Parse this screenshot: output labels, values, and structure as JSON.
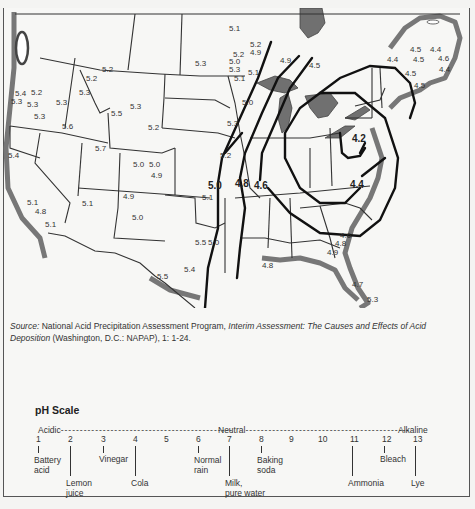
{
  "map": {
    "title": "Precipitation pH, continental United States and eastern Canada",
    "isopleth_labels": [
      {
        "value": "5.0",
        "x": 214,
        "y": 181
      },
      {
        "value": "4.8",
        "x": 240,
        "y": 179
      },
      {
        "value": "4.6",
        "x": 261,
        "y": 181
      },
      {
        "value": "4.4",
        "x": 352,
        "y": 180
      },
      {
        "value": "4.2",
        "x": 357,
        "y": 134
      }
    ],
    "station_values": [
      {
        "value": "5.1",
        "x": 229,
        "y": 23
      },
      {
        "value": "5.2",
        "x": 250,
        "y": 39
      },
      {
        "value": "4.9",
        "x": 250,
        "y": 47
      },
      {
        "value": "5.2",
        "x": 233,
        "y": 49
      },
      {
        "value": "5.0",
        "x": 229,
        "y": 56
      },
      {
        "value": "5.3",
        "x": 229,
        "y": 64
      },
      {
        "value": "5.1",
        "x": 248,
        "y": 67
      },
      {
        "value": "5.1",
        "x": 234,
        "y": 73
      },
      {
        "value": "5.0",
        "x": 242,
        "y": 97
      },
      {
        "value": "5.3",
        "x": 227,
        "y": 118
      },
      {
        "value": "5.2",
        "x": 220,
        "y": 150
      },
      {
        "value": "4.9",
        "x": 280,
        "y": 55
      },
      {
        "value": "4.5",
        "x": 309,
        "y": 60
      },
      {
        "value": "5.3",
        "x": 195,
        "y": 58
      },
      {
        "value": "5.2",
        "x": 102,
        "y": 64
      },
      {
        "value": "5.2",
        "x": 86,
        "y": 73
      },
      {
        "value": "5.4",
        "x": 15,
        "y": 88
      },
      {
        "value": "5.2",
        "x": 31,
        "y": 87
      },
      {
        "value": "5.3",
        "x": 11,
        "y": 96
      },
      {
        "value": "5.3",
        "x": 27,
        "y": 99
      },
      {
        "value": "5.3",
        "x": 56,
        "y": 97
      },
      {
        "value": "5.3",
        "x": 79,
        "y": 87
      },
      {
        "value": "5.3",
        "x": 34,
        "y": 111
      },
      {
        "value": "5.6",
        "x": 62,
        "y": 121
      },
      {
        "value": "5.5",
        "x": 111,
        "y": 108
      },
      {
        "value": "5.3",
        "x": 130,
        "y": 101
      },
      {
        "value": "5.2",
        "x": 148,
        "y": 122
      },
      {
        "value": "5.7",
        "x": 95,
        "y": 143
      },
      {
        "value": "5.4",
        "x": 8,
        "y": 150
      },
      {
        "value": "5.0",
        "x": 133,
        "y": 159
      },
      {
        "value": "5.0",
        "x": 149,
        "y": 159
      },
      {
        "value": "4.9",
        "x": 151,
        "y": 170
      },
      {
        "value": "4.9",
        "x": 123,
        "y": 191
      },
      {
        "value": "5.1",
        "x": 202,
        "y": 192
      },
      {
        "value": "5.1",
        "x": 27,
        "y": 197
      },
      {
        "value": "4.8",
        "x": 35,
        "y": 206
      },
      {
        "value": "5.1",
        "x": 45,
        "y": 219
      },
      {
        "value": "5.1",
        "x": 82,
        "y": 198
      },
      {
        "value": "5.0",
        "x": 132,
        "y": 212
      },
      {
        "value": "5.5",
        "x": 195,
        "y": 237
      },
      {
        "value": "5.0",
        "x": 208,
        "y": 237
      },
      {
        "value": "5.4",
        "x": 184,
        "y": 264
      },
      {
        "value": "5.5",
        "x": 157,
        "y": 271
      },
      {
        "value": "4.6",
        "x": 340,
        "y": 230
      },
      {
        "value": "4.8",
        "x": 335,
        "y": 238
      },
      {
        "value": "4.9",
        "x": 327,
        "y": 247
      },
      {
        "value": "4.8",
        "x": 262,
        "y": 260
      },
      {
        "value": "4.7",
        "x": 352,
        "y": 279
      },
      {
        "value": "5.3",
        "x": 367,
        "y": 294
      },
      {
        "value": "4.4",
        "x": 387,
        "y": 54
      },
      {
        "value": "4.5",
        "x": 410,
        "y": 44
      },
      {
        "value": "4.4",
        "x": 430,
        "y": 44
      },
      {
        "value": "4.5",
        "x": 413,
        "y": 54
      },
      {
        "value": "4.6",
        "x": 438,
        "y": 53
      },
      {
        "value": "4.4",
        "x": 439,
        "y": 64
      },
      {
        "value": "4.5",
        "x": 405,
        "y": 68
      },
      {
        "value": "4.5",
        "x": 414,
        "y": 80
      }
    ]
  },
  "source": {
    "label": "Source:",
    "text_before": " National Acid Precipitation Assessment Program, ",
    "italic_title": "Interim Assessment: The Causes and Effects of Acid Deposition",
    "text_after": " (Washington, D.C.: NAPAP), 1: 1-24."
  },
  "ph_scale": {
    "title": "pH Scale",
    "acidic_label": "Acidic",
    "neutral_label": "Neutral",
    "alkaline_label": "Alkaline",
    "ticks": [
      "1",
      "2",
      "3",
      "4",
      "5",
      "6",
      "7",
      "8",
      "9",
      "10",
      "11",
      "12",
      "13"
    ],
    "examples": [
      {
        "ph": "1",
        "label_line1": "Battery",
        "label_line2": "acid"
      },
      {
        "ph": "2",
        "label_line1": "Lemon",
        "label_line2": "juice"
      },
      {
        "ph": "3",
        "label_line1": "Vinegar",
        "label_line2": ""
      },
      {
        "ph": "4",
        "label_line1": "Cola",
        "label_line2": ""
      },
      {
        "ph": "6",
        "label_line1": "Normal",
        "label_line2": "rain"
      },
      {
        "ph": "7",
        "label_line1": "Milk,",
        "label_line2": "pure water"
      },
      {
        "ph": "8",
        "label_line1": "Baking",
        "label_line2": "soda"
      },
      {
        "ph": "11",
        "label_line1": "Ammonia",
        "label_line2": ""
      },
      {
        "ph": "12",
        "label_line1": "Bleach",
        "label_line2": ""
      },
      {
        "ph": "13",
        "label_line1": "Lye",
        "label_line2": ""
      }
    ]
  }
}
